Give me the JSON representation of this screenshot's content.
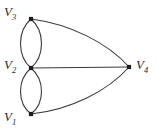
{
  "figure": {
    "background_color": "#ffffff",
    "edge_color": "#3a3a3a",
    "vertex_color": "#1c1c1c",
    "label_color": "#2a2a2a",
    "width": 157,
    "height": 133
  },
  "vertices": [
    {
      "id": "V3",
      "letter": "V",
      "index": "3",
      "x": 31,
      "y": 19,
      "label_x": 4,
      "label_y": 5,
      "label_text": "V3"
    },
    {
      "id": "V2",
      "letter": "V",
      "index": "2",
      "x": 31,
      "y": 68,
      "label_x": 4,
      "label_y": 58,
      "label_text": "V2"
    },
    {
      "id": "V1",
      "letter": "V",
      "index": "1",
      "x": 31,
      "y": 114,
      "label_x": 4,
      "label_y": 110,
      "label_text": "V1"
    },
    {
      "id": "V4",
      "letter": "V",
      "index": "4",
      "x": 129,
      "y": 67,
      "label_x": 136,
      "label_y": 58,
      "label_text": "V4"
    }
  ],
  "edges": [
    {
      "id": "e1",
      "from": "V3",
      "to": "V2",
      "style": "curved-left",
      "path": "M 31 19 C 17 31, 17 56, 31 68"
    },
    {
      "id": "e2",
      "from": "V3",
      "to": "V2",
      "style": "curved-right",
      "path": "M 31 19 C 45 31, 45 56, 31 68"
    },
    {
      "id": "e3",
      "from": "V2",
      "to": "V1",
      "style": "curved-left",
      "path": "M 31 68 C 17 80, 17 103, 31 114"
    },
    {
      "id": "e4",
      "from": "V2",
      "to": "V1",
      "style": "curved-right",
      "path": "M 31 68 C 45 80, 45 103, 31 114"
    },
    {
      "id": "e5",
      "from": "V3",
      "to": "V4",
      "style": "curved-outward",
      "path": "M 31 19 C 70 24, 108 43, 129 67"
    },
    {
      "id": "e6",
      "from": "V2",
      "to": "V4",
      "style": "straight",
      "path": "M 31 68 L 129 67"
    },
    {
      "id": "e7",
      "from": "V1",
      "to": "V4",
      "style": "curved-outward",
      "path": "M 31 114 C 70 110, 108 91, 129 67"
    }
  ],
  "counts": {
    "vertex_count": "4",
    "edge_count": "7"
  }
}
